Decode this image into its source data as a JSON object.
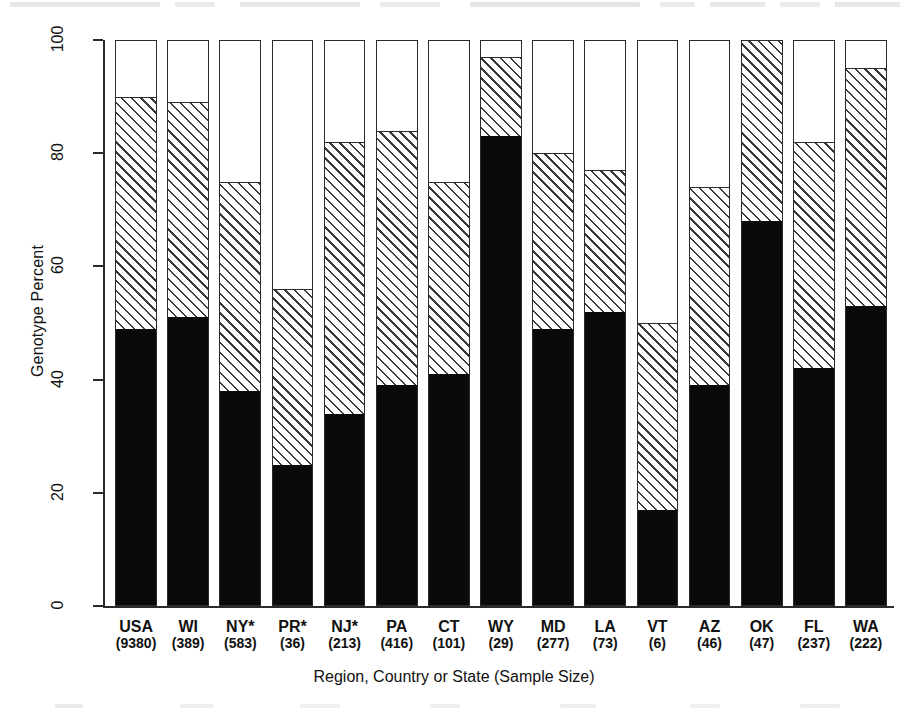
{
  "chart_data": {
    "type": "bar",
    "subtype": "stacked-bar-100-percent",
    "title": "",
    "xlabel": "Region, Country or State (Sample Size)",
    "ylabel": "Genotype Percent",
    "ylim": [
      0,
      100
    ],
    "yticks": [
      0,
      20,
      40,
      60,
      80,
      100
    ],
    "ytick_labels": [
      "0",
      "20",
      "40",
      "60",
      "80",
      "100"
    ],
    "grid": false,
    "legend": "none",
    "stack_order_bottom_to_top": [
      "solid",
      "hatched",
      "open"
    ],
    "categories": [
      "USA",
      "WI",
      "NY*",
      "PR*",
      "NJ*",
      "PA",
      "CT",
      "WY",
      "MD",
      "LA",
      "VT",
      "AZ",
      "OK",
      "FL",
      "WA"
    ],
    "sample_sizes": [
      9380,
      389,
      583,
      36,
      213,
      416,
      101,
      29,
      277,
      73,
      6,
      46,
      47,
      237,
      222
    ],
    "tick_labels": [
      "USA\n(9380)",
      "WI\n(389)",
      "NY*\n(583)",
      "PR*\n(36)",
      "NJ*\n(213)",
      "PA\n(416)",
      "CT\n(101)",
      "WY\n(29)",
      "MD\n(277)",
      "LA\n(73)",
      "VT\n(6)",
      "AZ\n(46)",
      "OK\n(47)",
      "FL\n(237)",
      "WA\n(222)"
    ],
    "series": [
      {
        "name": "solid",
        "fill": "solid-black",
        "color": "#0a0a0a",
        "values": [
          49,
          51,
          38,
          25,
          34,
          39,
          41,
          83,
          49,
          52,
          17,
          39,
          68,
          42,
          53
        ]
      },
      {
        "name": "hatched",
        "fill": "diagonal-hatch",
        "color": "#ffffff",
        "values": [
          41,
          38,
          37,
          31,
          48,
          45,
          34,
          14,
          31,
          25,
          33,
          35,
          32,
          40,
          42
        ]
      },
      {
        "name": "open",
        "fill": "open-white",
        "color": "#ffffff",
        "values": [
          10,
          11,
          25,
          44,
          18,
          16,
          25,
          3,
          20,
          23,
          50,
          26,
          0,
          18,
          5
        ]
      }
    ],
    "cumulative_tops": {
      "solid_top": [
        49,
        51,
        38,
        25,
        34,
        39,
        41,
        83,
        49,
        52,
        17,
        39,
        68,
        42,
        53
      ],
      "hatched_top": [
        90,
        89,
        75,
        56,
        82,
        84,
        75,
        97,
        80,
        77,
        50,
        74,
        100,
        82,
        95
      ],
      "open_top": [
        100,
        100,
        100,
        100,
        100,
        100,
        100,
        100,
        100,
        100,
        100,
        100,
        100,
        100,
        100
      ]
    }
  },
  "axes": {
    "y_title": "Genotype Percent",
    "x_title": "Region, Country or State (Sample Size)"
  },
  "bars": [
    {
      "code": "USA",
      "size": "(9380)",
      "solid": 49,
      "hatched": 41,
      "open": 10
    },
    {
      "code": "WI",
      "size": "(389)",
      "solid": 51,
      "hatched": 38,
      "open": 11
    },
    {
      "code": "NY*",
      "size": "(583)",
      "solid": 38,
      "hatched": 37,
      "open": 25
    },
    {
      "code": "PR*",
      "size": "(36)",
      "solid": 25,
      "hatched": 31,
      "open": 44
    },
    {
      "code": "NJ*",
      "size": "(213)",
      "solid": 34,
      "hatched": 48,
      "open": 18
    },
    {
      "code": "PA",
      "size": "(416)",
      "solid": 39,
      "hatched": 45,
      "open": 16
    },
    {
      "code": "CT",
      "size": "(101)",
      "solid": 41,
      "hatched": 34,
      "open": 25
    },
    {
      "code": "WY",
      "size": "(29)",
      "solid": 83,
      "hatched": 14,
      "open": 3
    },
    {
      "code": "MD",
      "size": "(277)",
      "solid": 49,
      "hatched": 31,
      "open": 20
    },
    {
      "code": "LA",
      "size": "(73)",
      "solid": 52,
      "hatched": 25,
      "open": 23
    },
    {
      "code": "VT",
      "size": "(6)",
      "solid": 17,
      "hatched": 33,
      "open": 50
    },
    {
      "code": "AZ",
      "size": "(46)",
      "solid": 39,
      "hatched": 35,
      "open": 26
    },
    {
      "code": "OK",
      "size": "(47)",
      "solid": 68,
      "hatched": 32,
      "open": 0
    },
    {
      "code": "FL",
      "size": "(237)",
      "solid": 42,
      "hatched": 40,
      "open": 18
    },
    {
      "code": "WA",
      "size": "(222)",
      "solid": 53,
      "hatched": 42,
      "open": 5
    }
  ],
  "yticks": [
    {
      "value": 100,
      "label": "100"
    },
    {
      "value": 80,
      "label": "80"
    },
    {
      "value": 60,
      "label": "60"
    },
    {
      "value": 40,
      "label": "40"
    },
    {
      "value": 20,
      "label": "20"
    },
    {
      "value": 0,
      "label": "0"
    }
  ],
  "colors": {
    "ink": "#2b2b2b",
    "solid_fill": "#0a0a0a",
    "open_fill": "#ffffff",
    "hatch_line": "#3a3a3a"
  }
}
